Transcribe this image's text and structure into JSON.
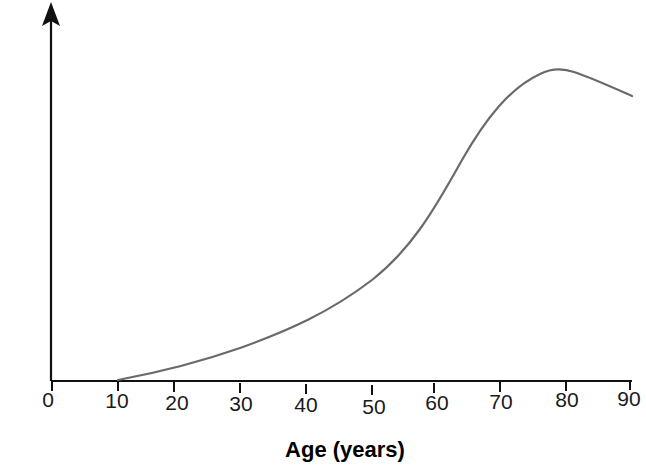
{
  "figure": {
    "width": 646,
    "height": 472,
    "background_color": "#ffffff"
  },
  "chart_data": {
    "type": "line",
    "title": "",
    "subtitle": "",
    "xlabel": "Age (years)",
    "ylabel": "",
    "xlim": [
      0,
      90
    ],
    "ylim": [
      0,
      100
    ],
    "xticks": [
      0,
      10,
      20,
      30,
      40,
      50,
      60,
      70,
      80,
      90
    ],
    "xtick_labels": [
      "0",
      "10",
      "20",
      "30",
      "40",
      "50",
      "60",
      "70",
      "80",
      "90"
    ],
    "yticks": [],
    "ytick_labels": [],
    "grid": false,
    "legend": false,
    "legend_position": "none",
    "annotations": [],
    "series": [
      {
        "name": "rate",
        "color": "#6a6a6a",
        "line_width": 2,
        "x": [
          10,
          15,
          20,
          25,
          30,
          35,
          40,
          45,
          50,
          55,
          60,
          65,
          70,
          75,
          77,
          80,
          85,
          90
        ],
        "values": [
          0,
          1.5,
          3.5,
          6,
          9,
          12.5,
          17,
          22.5,
          29,
          38,
          51,
          65,
          76,
          83,
          84,
          83.5,
          81,
          78
        ]
      }
    ]
  },
  "axes": {
    "y_axis": {
      "name": "vertical-axis",
      "has_arrowhead": true,
      "color": "#111111",
      "x_px": 51,
      "top_px": 2,
      "bottom_px": 381
    },
    "x_axis": {
      "name": "horizontal-axis",
      "color": "#111111",
      "y_px": 381,
      "left_px": 51,
      "right_px": 632,
      "tick_length_px": 10
    }
  },
  "geometry": {
    "tick_px": [
      52,
      118,
      174,
      240,
      306,
      372,
      434,
      500,
      566,
      630
    ],
    "tick_label_y_px": [
      403,
      404,
      405,
      406,
      407,
      409,
      406,
      405,
      404,
      403
    ],
    "curve_path": "M 118 380 C 150 374, 200 362, 240 348 C 290 330, 330 312, 372 280 C 410 250, 432 214, 462 160 C 486 118, 510 88, 540 74 C 550 69, 562 68, 574 72 C 592 78, 614 88, 632 96",
    "axis_title_x_px": 345,
    "axis_title_y_px": 455
  }
}
